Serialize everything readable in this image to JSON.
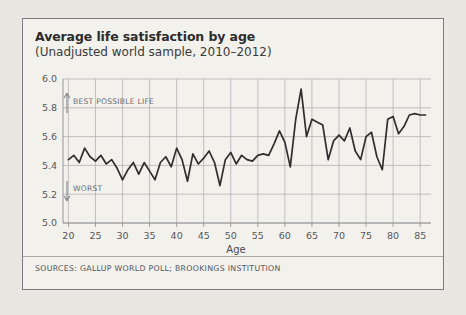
{
  "figure": {
    "title": "Average life satisfaction by age",
    "subtitle": "(Unadjusted world sample, 2010–2012)",
    "sources": "SOURCES: GALLUP WORLD POLL; BROOKINGS INSTITUTION",
    "background_color": "#f3f1ec",
    "page_background_color": "#e9e7e2",
    "border_color": "#7b7d80"
  },
  "annotations": {
    "top": {
      "arrow": "↑",
      "label": "BEST POSSIBLE LIFE"
    },
    "bottom": {
      "arrow": "↓",
      "label": "WORST"
    }
  },
  "chart_data": {
    "type": "line",
    "title": "Average life satisfaction by age",
    "subtitle": "(Unadjusted world sample, 2010–2012)",
    "xlabel": "Age",
    "ylabel": "",
    "xlim": [
      19,
      87
    ],
    "ylim": [
      5.0,
      6.0
    ],
    "xticks": [
      20,
      25,
      30,
      35,
      40,
      45,
      50,
      55,
      60,
      65,
      70,
      75,
      80,
      85
    ],
    "yticks": [
      "5.0",
      "5.2",
      "5.4",
      "5.6",
      "5.8",
      "6.0"
    ],
    "grid": true,
    "legend": null,
    "line_color": "#2e2e2e",
    "series": [
      {
        "name": "Average life satisfaction",
        "x": [
          20,
          21,
          22,
          23,
          24,
          25,
          26,
          27,
          28,
          29,
          30,
          31,
          32,
          33,
          34,
          35,
          36,
          37,
          38,
          39,
          40,
          41,
          42,
          43,
          44,
          45,
          46,
          47,
          48,
          49,
          50,
          51,
          52,
          53,
          54,
          55,
          56,
          57,
          58,
          59,
          60,
          61,
          62,
          63,
          64,
          65,
          66,
          67,
          68,
          69,
          70,
          71,
          72,
          73,
          74,
          75,
          76,
          77,
          78,
          79,
          80,
          81,
          82,
          83,
          84,
          85,
          86
        ],
        "values": [
          5.44,
          5.47,
          5.42,
          5.52,
          5.46,
          5.43,
          5.47,
          5.41,
          5.44,
          5.38,
          5.3,
          5.37,
          5.42,
          5.34,
          5.42,
          5.36,
          5.3,
          5.42,
          5.46,
          5.39,
          5.52,
          5.44,
          5.29,
          5.48,
          5.41,
          5.45,
          5.5,
          5.42,
          5.26,
          5.44,
          5.49,
          5.41,
          5.47,
          5.44,
          5.43,
          5.47,
          5.48,
          5.47,
          5.55,
          5.64,
          5.56,
          5.39,
          5.72,
          5.93,
          5.6,
          5.72,
          5.7,
          5.68,
          5.44,
          5.57,
          5.61,
          5.57,
          5.66,
          5.5,
          5.44,
          5.6,
          5.63,
          5.46,
          5.37,
          5.72,
          5.74,
          5.62,
          5.67,
          5.75,
          5.76,
          5.75,
          5.75
        ]
      }
    ]
  }
}
